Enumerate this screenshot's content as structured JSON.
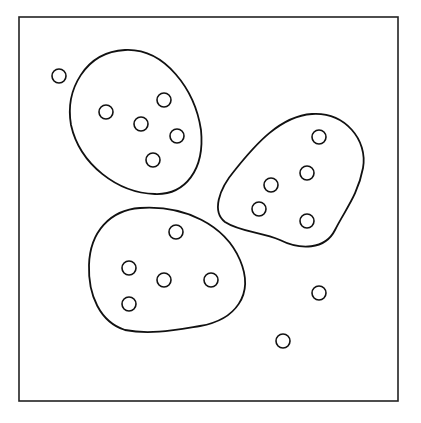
{
  "diagram": {
    "title": "",
    "clusters": [
      {
        "name": "cluster-1",
        "point_count": 5
      },
      {
        "name": "cluster-2",
        "point_count": 5
      },
      {
        "name": "cluster-3",
        "point_count": 5
      }
    ],
    "outlier_count": 3
  }
}
